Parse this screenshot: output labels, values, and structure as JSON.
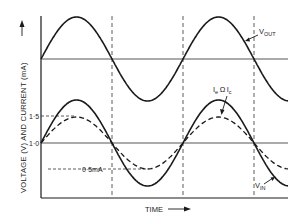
{
  "chart_data": {
    "type": "line",
    "title": "",
    "xlabel": "TIME",
    "ylabel": "VOLTAGE (V) AND CURRENT (mA)",
    "y_ticks": [
      {
        "label": "1·5",
        "value": 1.5
      },
      {
        "label": "1·0",
        "value": 1.0
      }
    ],
    "annotations": [
      {
        "text": "0·5mA",
        "value": 0.5
      },
      {
        "text": "V_OUT",
        "points_to": "output voltage curve"
      },
      {
        "text": "I_e Ω I_c",
        "points_to": "emitter/collector current curve"
      },
      {
        "text": "V_IN",
        "points_to": "input voltage curve"
      }
    ],
    "grid": false,
    "dashed_vertical_markers_at_half_periods": [
      1,
      2,
      3
    ],
    "series": [
      {
        "name": "V_OUT",
        "style": "solid",
        "waveform": "sine",
        "center_level": "upper baseline",
        "cycles_shown": 1.75
      },
      {
        "name": "V_IN",
        "style": "solid",
        "waveform": "sine",
        "center": 1.0,
        "peak": 1.8,
        "trough": 0.2,
        "cycles_shown": 1.75
      },
      {
        "name": "I_e Ω I_c",
        "style": "dashed",
        "waveform": "sine",
        "center": 1.0,
        "peak": 1.5,
        "trough": 0.5,
        "cycles_shown": 1.75
      }
    ]
  },
  "labels": {
    "y_axis": "VOLTAGE (V) AND CURRENT (mA)",
    "x_axis": "TIME",
    "tick_15": "1·5",
    "tick_10": "1·0",
    "ann_05": "0·5mA",
    "vout_main": "V",
    "vout_sub": "OUT",
    "vin_main": "V",
    "vin_sub": "IN",
    "ie_main": "I",
    "ie_sub": "e",
    "approx": "Ω",
    "ic_main": "I",
    "ic_sub": "c"
  },
  "colors": {
    "ink": "#1a1a1a",
    "background": "#ffffff"
  }
}
